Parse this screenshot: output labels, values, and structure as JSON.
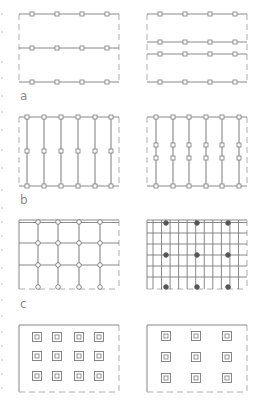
{
  "figure": {
    "labels": [
      "a",
      "b",
      "c"
    ],
    "colors": {
      "line": "#7a7a7a",
      "dash": "#9a9a9a",
      "node_fill": "#ffffff",
      "node_dark": "#555555",
      "label": "#8a8a8a"
    },
    "panels": [
      {
        "id": "a-left",
        "row": "a",
        "column": "left",
        "description": "Two-way slab strip: horizontal beams at top, middle, bottom with 4 square nodes each",
        "horizontal_lines": 3,
        "vertical_lines": 0,
        "node_columns": 4,
        "node_rows": 3
      },
      {
        "id": "a-right",
        "row": "a",
        "column": "right",
        "description": "Horizontal beams at top, paired middle beams, bottom with 4 square nodes each",
        "horizontal_lines": 4,
        "vertical_lines": 0,
        "node_columns": 4,
        "node_rows": 4
      },
      {
        "id": "b-left",
        "row": "b",
        "column": "left",
        "description": "Six vertical members with nodes at top, middle and bottom",
        "horizontal_lines": 2,
        "vertical_lines": 6,
        "node_columns": 6,
        "node_rows": 3
      },
      {
        "id": "b-right",
        "row": "b",
        "column": "right",
        "description": "Six vertical members with nodes at top, two intermediate rows and bottom",
        "horizontal_lines": 2,
        "vertical_lines": 6,
        "node_columns": 6,
        "node_rows": 4
      },
      {
        "id": "c-left",
        "row": "c",
        "column": "left",
        "description": "Orthogonal grid of 4 verticals by 4 horizontals with circular nodes at intersections",
        "horizontal_lines": 4,
        "vertical_lines": 4,
        "node_columns": 4,
        "node_rows": 4
      },
      {
        "id": "c-right",
        "row": "c",
        "column": "right",
        "description": "Dense orthogonal grid with dark circular nodes at 3x3 positions",
        "horizontal_lines": 7,
        "vertical_lines": 11,
        "node_columns": 3,
        "node_rows": 3
      },
      {
        "id": "d-left",
        "row": "d",
        "column": "left",
        "description": "Isolated column footings: 4 by 3 nested squares",
        "horizontal_lines": 0,
        "vertical_lines": 0,
        "node_columns": 4,
        "node_rows": 3
      },
      {
        "id": "d-right",
        "row": "d",
        "column": "right",
        "description": "Isolated column footings: 3 by 3 nested squares",
        "horizontal_lines": 0,
        "vertical_lines": 0,
        "node_columns": 3,
        "node_rows": 3
      }
    ]
  }
}
